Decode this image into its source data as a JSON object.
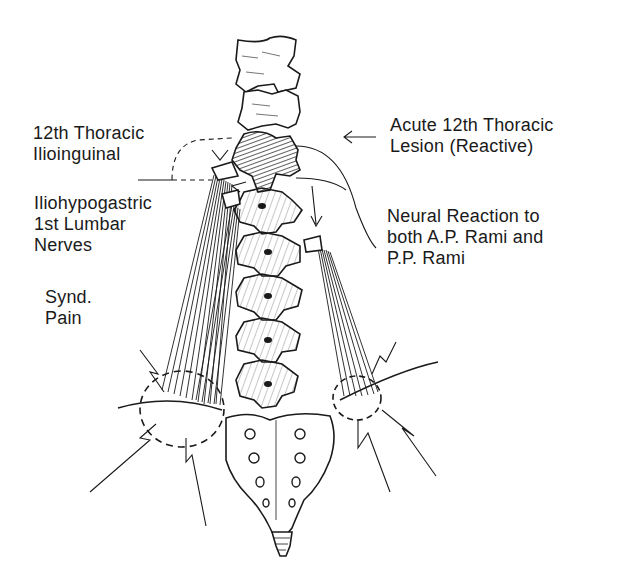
{
  "figure": {
    "type": "anatomical-line-drawing",
    "colors": {
      "ink": "#1a1a1a",
      "background": "#ffffff"
    }
  },
  "labels": {
    "left_top": {
      "line1": "12th Thoracic",
      "line2": "Ilioinguinal"
    },
    "left_mid": {
      "line1": "Iliohypogastric",
      "line2": "1st Lumbar",
      "line3": "Nerves"
    },
    "left_bottom": {
      "line1": "Synd.",
      "line2": "Pain"
    },
    "right_top": {
      "line1": "Acute 12th Thoracic",
      "line2": "Lesion (Reactive)"
    },
    "right_mid": {
      "line1": "Neural Reaction to",
      "line2": "both A.P. Rami and",
      "line3": "P.P. Rami"
    }
  }
}
